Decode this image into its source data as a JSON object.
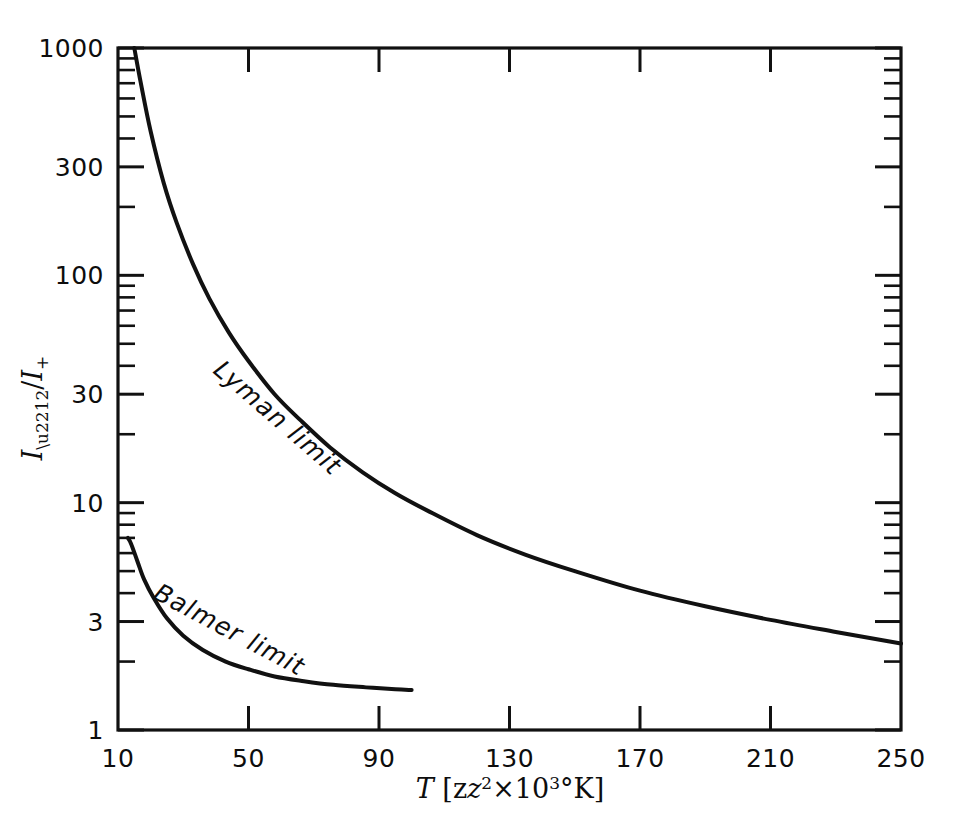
{
  "figure": {
    "background_color": "#ffffff",
    "ink_color": "#111111"
  },
  "axes": {
    "x_label_main": "T",
    "x_label_bracket_open": " [z",
    "x_label_exp_z": "2",
    "x_label_times": "×10",
    "x_label_exp_ten": "3",
    "x_label_units": "°K]",
    "y_label": "I−/I+",
    "x_ticklabels": [
      "10",
      "50",
      "90",
      "130",
      "170",
      "210",
      "250"
    ],
    "y_ticklabels": [
      "1",
      "3",
      "10",
      "30",
      "100",
      "300",
      "1000"
    ]
  },
  "annotations": [
    {
      "text": "Lyman limit",
      "name": "lyman-limit-label"
    },
    {
      "text": "Balmer limit",
      "name": "balmer-limit-label"
    }
  ],
  "chart_data": {
    "type": "line",
    "title": "",
    "xlabel": "T [z²×10³ °K]",
    "ylabel": "I−/I+",
    "xscale": "linear",
    "yscale": "log",
    "xlim": [
      10,
      250
    ],
    "ylim": [
      1,
      1000
    ],
    "xticks": [
      10,
      50,
      90,
      130,
      170,
      210,
      250
    ],
    "yticks": [
      1,
      3,
      10,
      30,
      100,
      300,
      1000
    ],
    "grid": false,
    "legend": "none (curves labelled inline)",
    "series": [
      {
        "name": "Lyman limit",
        "x": [
          15,
          17,
          20,
          24,
          28,
          33,
          38,
          44,
          50,
          58,
          66,
          75,
          85,
          95,
          105,
          120,
          135,
          150,
          170,
          190,
          210,
          230,
          250
        ],
        "y": [
          1000,
          700,
          430,
          255,
          170,
          112,
          79,
          56,
          42,
          30,
          23,
          17.5,
          13.6,
          11.0,
          9.2,
          7.2,
          5.9,
          5.0,
          4.1,
          3.5,
          3.05,
          2.7,
          2.4
        ]
      },
      {
        "name": "Balmer limit",
        "x": [
          13,
          14,
          16,
          18,
          21,
          25,
          30,
          36,
          43,
          50,
          58,
          67,
          76,
          86,
          95,
          100
        ],
        "y": [
          7.0,
          6.6,
          5.5,
          4.6,
          3.8,
          3.1,
          2.6,
          2.25,
          2.0,
          1.85,
          1.72,
          1.64,
          1.58,
          1.54,
          1.51,
          1.5
        ]
      }
    ]
  }
}
